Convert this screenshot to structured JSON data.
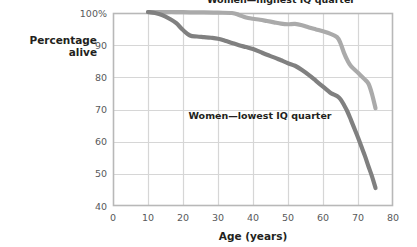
{
  "chart_data": {
    "type": "line",
    "title": "",
    "xlabel": "Age (years)",
    "ylabel": "Percentage alive",
    "ylabel_line1": "Percentage",
    "ylabel_line2": "alive",
    "xlim": [
      0,
      80
    ],
    "ylim": [
      40,
      100
    ],
    "xticks": [
      0,
      10,
      20,
      30,
      40,
      50,
      60,
      70,
      80
    ],
    "xticklabels": [
      "0",
      "10",
      "20",
      "30",
      "40",
      "50",
      "60",
      "70",
      "80"
    ],
    "yticks": [
      40,
      50,
      60,
      70,
      80,
      90,
      100
    ],
    "yticklabels": [
      "40",
      "50",
      "60",
      "70",
      "80",
      "90",
      "100%"
    ],
    "grid": true,
    "legend_position": "inline-annotation",
    "series": [
      {
        "name": "Women—highest IQ quarter",
        "color": "#aaaaaa",
        "label_x": 48,
        "label_y": 103.2,
        "x": [
          10,
          14,
          18,
          22,
          26,
          30,
          34,
          36,
          38,
          40,
          42,
          44,
          46,
          48,
          50,
          52,
          54,
          56,
          58,
          60,
          62,
          64,
          65,
          66,
          67,
          68,
          70,
          72,
          73,
          74,
          75
        ],
        "y": [
          100.3,
          100.3,
          100.3,
          100.2,
          100.2,
          100.1,
          100.0,
          99.4,
          98.6,
          98.2,
          97.9,
          97.5,
          97.1,
          96.7,
          96.5,
          96.6,
          96.2,
          95.5,
          94.9,
          94.3,
          93.6,
          92.5,
          90.6,
          87.6,
          85.2,
          83.5,
          81.4,
          79.3,
          78.0,
          74.8,
          70.4
        ]
      },
      {
        "name": "Women—lowest IQ quarter",
        "color": "#808080",
        "label_x": 42,
        "label_y": 67.0,
        "x": [
          10,
          12,
          14,
          16,
          18,
          20,
          22,
          24,
          26,
          28,
          30,
          32,
          34,
          36,
          38,
          40,
          42,
          44,
          46,
          48,
          50,
          52,
          54,
          56,
          58,
          60,
          62,
          63,
          64,
          65,
          66,
          67,
          68,
          69,
          70,
          71,
          72,
          73,
          74,
          75
        ],
        "y": [
          100.3,
          100.0,
          99.4,
          98.3,
          96.9,
          94.7,
          93.0,
          92.7,
          92.5,
          92.3,
          92.0,
          91.4,
          90.7,
          90.0,
          89.4,
          88.8,
          87.9,
          87.0,
          86.2,
          85.3,
          84.4,
          83.6,
          82.3,
          80.7,
          78.9,
          77.1,
          75.3,
          74.7,
          74.2,
          73.2,
          71.4,
          69.3,
          66.7,
          64.0,
          61.3,
          58.4,
          55.5,
          52.3,
          49.2,
          45.6
        ]
      }
    ]
  },
  "plot_geometry": {
    "left_px": 113,
    "right_px": 393,
    "top_px": 13,
    "bottom_px": 206
  },
  "colors": {
    "frame": "#b8b8b8",
    "gridline": "#d6d6d6",
    "background": "#ffffff",
    "text": "#231f20",
    "tick_text": "#58595b"
  }
}
